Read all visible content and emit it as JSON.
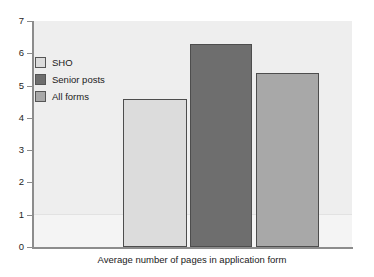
{
  "chart_data": {
    "type": "bar",
    "title": "",
    "subtitle": "",
    "xlabel": "Average number of pages in application form",
    "ylabel": "",
    "categories": [
      "SHO",
      "Senior posts",
      "All forms"
    ],
    "values": [
      4.6,
      6.3,
      5.4
    ],
    "series": [
      {
        "name": "Average number of pages in application form",
        "values": [
          4.6,
          6.3,
          5.4
        ]
      }
    ],
    "ylim": [
      0,
      7
    ],
    "yticks": [
      0,
      1,
      2,
      3,
      4,
      5,
      6,
      7
    ],
    "ytick_labels": [
      "0",
      "1",
      "2",
      "3",
      "4",
      "5",
      "6",
      "7"
    ],
    "xticks": [],
    "xtick_labels": [],
    "grid": false,
    "legend_position": "upper left",
    "legend": [
      "SHO",
      "Senior posts",
      "All forms"
    ],
    "bar_colors": [
      "#dcdcdc",
      "#6e6e6e",
      "#a8a8a8"
    ],
    "bar_edge_color": "#4d4d4d",
    "plot_background": "#eeeeee",
    "figure_background": "#ffffff",
    "axis_color": "#8c8c8c",
    "text_color": "#1a1a1a"
  },
  "axes": {
    "y_ticks": [
      {
        "label": "7",
        "value": 7
      },
      {
        "label": "6",
        "value": 6
      },
      {
        "label": "5",
        "value": 5
      },
      {
        "label": "4",
        "value": 4
      },
      {
        "label": "3",
        "value": 3
      },
      {
        "label": "2",
        "value": 2
      },
      {
        "label": "1",
        "value": 1
      },
      {
        "label": "0",
        "value": 0
      }
    ],
    "x_title": "Average number of pages in application form"
  },
  "legend": {
    "items": [
      {
        "label": "SHO",
        "color": "#dcdcdc"
      },
      {
        "label": "Senior posts",
        "color": "#6e6e6e"
      },
      {
        "label": "All forms",
        "color": "#a8a8a8"
      }
    ]
  },
  "bars": [
    {
      "label": "SHO",
      "value": 4.6,
      "color": "#dcdcdc"
    },
    {
      "label": "Senior posts",
      "value": 6.3,
      "color": "#6e6e6e"
    },
    {
      "label": "All forms",
      "value": 5.4,
      "color": "#a8a8a8"
    }
  ]
}
